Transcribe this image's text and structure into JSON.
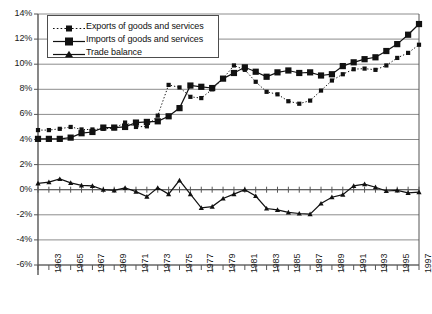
{
  "chart_data": {
    "type": "line",
    "title": "",
    "xlabel": "",
    "ylabel": "",
    "ylim": [
      -6,
      14
    ],
    "xlim": [
      1962,
      1997
    ],
    "ytick_labels": [
      "14%",
      "12%",
      "10%",
      "8%",
      "6%",
      "4%",
      "2%",
      "0%",
      "-2%",
      "-4%",
      "-6%"
    ],
    "ytick_values": [
      14,
      12,
      10,
      8,
      6,
      4,
      2,
      0,
      -2,
      -4,
      -6
    ],
    "grid": "horizontal",
    "legend_position": "top-left",
    "x": [
      1962,
      1963,
      1964,
      1965,
      1966,
      1967,
      1968,
      1969,
      1970,
      1971,
      1972,
      1973,
      1974,
      1975,
      1976,
      1977,
      1978,
      1979,
      1980,
      1981,
      1982,
      1983,
      1984,
      1985,
      1986,
      1987,
      1988,
      1989,
      1990,
      1991,
      1992,
      1993,
      1994,
      1995,
      1996,
      1997
    ],
    "xtick_labels": [
      "1963",
      "1965",
      "1967",
      "1969",
      "1971",
      "1973",
      "1975",
      "1977",
      "1979",
      "1981",
      "1983",
      "1985",
      "1987",
      "1989",
      "1991",
      "1993",
      "1995",
      "1997"
    ],
    "series": [
      {
        "name": "Exports of goods and services",
        "marker": "small-square",
        "line_style": "dotted",
        "color": "#111111",
        "values": [
          4.75,
          4.75,
          4.85,
          5.0,
          4.8,
          4.8,
          4.85,
          4.9,
          5.35,
          5.0,
          5.05,
          5.9,
          8.35,
          8.15,
          7.4,
          7.3,
          8.0,
          8.85,
          9.9,
          9.55,
          8.6,
          7.8,
          7.6,
          7.05,
          6.85,
          7.1,
          7.9,
          8.7,
          9.2,
          9.6,
          9.65,
          9.55,
          9.9,
          10.5,
          10.9,
          11.55
        ]
      },
      {
        "name": "Imports of goods and services",
        "marker": "large-square",
        "line_style": "solid",
        "color": "#111111",
        "values": [
          4.05,
          4.05,
          4.05,
          4.15,
          4.5,
          4.6,
          4.95,
          4.95,
          5.0,
          5.35,
          5.4,
          5.45,
          5.85,
          6.5,
          8.3,
          8.2,
          8.1,
          8.85,
          9.3,
          9.75,
          9.4,
          9.0,
          9.35,
          9.5,
          9.3,
          9.35,
          9.1,
          9.2,
          9.85,
          10.15,
          10.4,
          10.55,
          11.05,
          11.6,
          12.35,
          13.2
        ]
      },
      {
        "name": "Trade balance",
        "marker": "triangle",
        "line_style": "solid",
        "color": "#111111",
        "values": [
          0.5,
          0.6,
          0.85,
          0.55,
          0.35,
          0.3,
          0.0,
          -0.05,
          0.15,
          -0.15,
          -0.55,
          0.15,
          -0.35,
          0.75,
          -0.35,
          -1.45,
          -1.35,
          -0.7,
          -0.35,
          0.0,
          -0.5,
          -1.5,
          -1.6,
          -1.8,
          -1.9,
          -1.95,
          -1.1,
          -0.6,
          -0.4,
          0.3,
          0.45,
          0.2,
          -0.1,
          -0.05,
          -0.25,
          -0.2
        ]
      }
    ]
  },
  "legend": {
    "items": [
      {
        "label": "Exports of goods and services",
        "key": "dotted-small-square"
      },
      {
        "label": "Imports of goods and services",
        "key": "solid-large-square"
      },
      {
        "label": "Trade balance",
        "key": "solid-triangle"
      }
    ]
  }
}
